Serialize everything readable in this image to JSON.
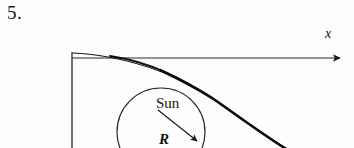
{
  "page": {
    "background_color": "#fdfdfd",
    "ink_color": "#141414",
    "width": 354,
    "height": 148
  },
  "problem": {
    "number_label": "5."
  },
  "figure": {
    "name": "comet-trajectory-around-sun",
    "axis": {
      "x_label": "x",
      "x_axis_start": [
        72,
        58
      ],
      "x_axis_end": [
        344,
        58
      ],
      "arrowhead_at": "right-end"
    },
    "vertical_line": {
      "name": "y-axis-segment",
      "start": [
        72,
        52
      ],
      "end": [
        72,
        148
      ]
    },
    "sun": {
      "label": "Sun",
      "circle_center": [
        161,
        132
      ],
      "circle_radius": 44
    },
    "radius_arrow": {
      "label": "R",
      "start": [
        158,
        110
      ],
      "end": [
        199,
        143
      ]
    },
    "trajectory_curve": {
      "name": "hyperbolic-trajectory",
      "description": "thick curve from origin sweeping right and down past the sun",
      "start": [
        73,
        53
      ],
      "end": [
        288,
        148
      ]
    }
  }
}
